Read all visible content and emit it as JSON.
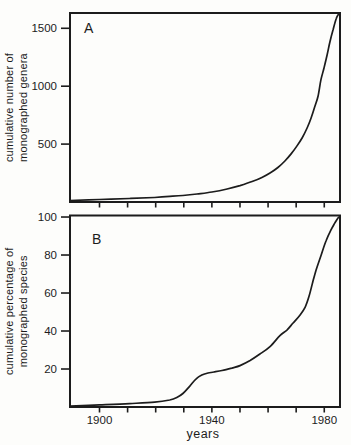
{
  "figure": {
    "xlabel": "years",
    "background_color": "#fdfdfb",
    "line_color": "#1c1c1c",
    "text_color": "#1c1c1c"
  },
  "chart_data": [
    {
      "type": "line",
      "panel_label": "A",
      "title": "",
      "ylabel": "cumulative number of monographed genera",
      "ylabel_lines": [
        "cumulative number of",
        "monographed genera"
      ],
      "xlabel": "",
      "xlim": [
        1889.5,
        1985.6
      ],
      "ylim": [
        0,
        1632
      ],
      "yticks": [
        500,
        1000,
        1500
      ],
      "ytick_labels": [
        "500",
        "1000",
        "1500"
      ],
      "xticks": [
        1900,
        1910,
        1920,
        1930,
        1940,
        1950,
        1960,
        1970,
        1980
      ],
      "xtick_labels": [
        "",
        "",
        "",
        "",
        "",
        "",
        "",
        "",
        ""
      ],
      "grid": false,
      "legend": false,
      "x": [
        1889.5,
        1900,
        1910.7,
        1919.6,
        1925,
        1929.7,
        1934.7,
        1940,
        1945.4,
        1950,
        1954.3,
        1957.8,
        1960.7,
        1963.5,
        1966,
        1968.2,
        1970.3,
        1972.1,
        1973.9,
        1975.3,
        1976.7,
        1977.8,
        1978.8,
        1979.9,
        1981,
        1982,
        1983.1,
        1984.2,
        1984.9,
        1985.6
      ],
      "y": [
        13,
        22,
        30,
        39,
        48,
        56,
        69,
        86,
        112,
        142,
        177,
        212,
        250,
        298,
        354,
        415,
        484,
        553,
        639,
        725,
        829,
        915,
        1054,
        1157,
        1269,
        1382,
        1485,
        1580,
        1615,
        1632
      ]
    },
    {
      "type": "line",
      "panel_label": "B",
      "title": "",
      "ylabel": "cumulative percentage of monographed species",
      "ylabel_lines": [
        "cumulative percentage of",
        "monographed species"
      ],
      "xlabel": "years",
      "xlim": [
        1889.5,
        1985.6
      ],
      "ylim": [
        0,
        100.8
      ],
      "yticks": [
        20,
        40,
        60,
        80,
        100
      ],
      "ytick_labels": [
        "20",
        "40",
        "60",
        "80",
        "100"
      ],
      "xticks": [
        1900,
        1910,
        1920,
        1930,
        1940,
        1950,
        1960,
        1970,
        1980
      ],
      "xtick_labels": [
        "1900",
        "",
        "",
        "",
        "1940",
        "",
        "",
        "",
        "1980"
      ],
      "grid": false,
      "legend": false,
      "x": [
        1889.5,
        1900,
        1910.7,
        1919.6,
        1925,
        1927.5,
        1929.7,
        1932.2,
        1934.3,
        1936.4,
        1938.6,
        1940.7,
        1943.6,
        1947.1,
        1950,
        1953.6,
        1957.1,
        1960.7,
        1964.2,
        1966.7,
        1968.9,
        1971.4,
        1973.2,
        1974.6,
        1976,
        1977.1,
        1978.9,
        1980.6,
        1982.4,
        1983.8,
        1984.9,
        1985.6
      ],
      "y": [
        0.5,
        1.1,
        1.8,
        2.6,
        3.7,
        5,
        7.1,
        11.1,
        14.7,
        16.8,
        17.9,
        18.4,
        19.2,
        20.5,
        21.8,
        24.5,
        27.9,
        31.8,
        37.6,
        40.5,
        44.2,
        48.4,
        52.6,
        58.4,
        66.3,
        72.1,
        80,
        87.4,
        93.2,
        96.9,
        99.5,
        100.3
      ]
    }
  ]
}
